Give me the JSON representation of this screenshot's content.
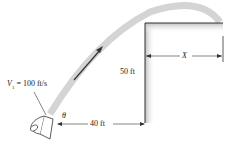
{
  "figure": {
    "labels": {
      "velocity_symbol": "V",
      "velocity_subscript": "1",
      "velocity_value": " = 100 ft/s",
      "angle": "θ",
      "horizontal_distance": "40 ft",
      "height": "50 ft",
      "unknown_distance": "X"
    },
    "colors": {
      "stream": "#d4d4d4",
      "wall": "#333333",
      "arrow": "#333333"
    }
  }
}
